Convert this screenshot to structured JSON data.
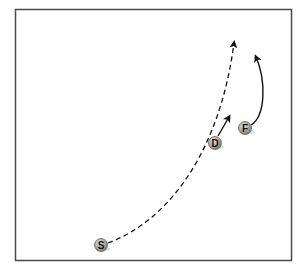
{
  "diagram": {
    "frame": {
      "x": 15,
      "y": 9,
      "w": 277,
      "h": 252,
      "stroke": "#4a4a4a"
    },
    "players": [
      {
        "id": "S",
        "label": "S",
        "x": 101,
        "y": 245
      },
      {
        "id": "D",
        "label": "D",
        "x": 215,
        "y": 143
      },
      {
        "id": "F",
        "label": "F",
        "x": 245,
        "y": 128
      }
    ],
    "routes": [
      {
        "from": "S",
        "style": "dashed",
        "description": "long curved dashed route upfield"
      },
      {
        "from": "D",
        "style": "solid",
        "description": "short straight solid arrow"
      },
      {
        "from": "F",
        "style": "solid",
        "description": "curved solid arrow upfield"
      }
    ],
    "colors": {
      "player_fill": "#9a9a9a",
      "player_stroke": "#555555",
      "line": "#111111"
    }
  }
}
